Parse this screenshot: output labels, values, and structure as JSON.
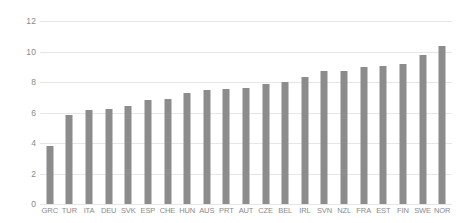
{
  "chart_data": {
    "type": "bar",
    "title": "",
    "subtitle": "",
    "xlabel": "",
    "ylabel": "",
    "ylim": [
      0,
      12
    ],
    "yticks": [
      0,
      2,
      4,
      6,
      8,
      10,
      12
    ],
    "ytick_labels": [
      "0",
      "2",
      "4",
      "6",
      "8",
      "10",
      "12"
    ],
    "grid": true,
    "legend": false,
    "legend_position": "none",
    "bar_color": "#8c8c8c",
    "gridline_color": "#e6e6e6",
    "tick_label_color": "#8a8a8a",
    "background_color": "#ffffff",
    "categories": [
      "GRC",
      "TUR",
      "ITA",
      "DEU",
      "SVK",
      "ESP",
      "CHE",
      "HUN",
      "AUS",
      "PRT",
      "AUT",
      "CZE",
      "BEL",
      "IRL",
      "SVN",
      "NZL",
      "FRA",
      "EST",
      "FIN",
      "SWE",
      "NOR"
    ],
    "values": [
      3.8,
      5.85,
      6.15,
      6.25,
      6.45,
      6.8,
      6.9,
      7.3,
      7.5,
      7.55,
      7.6,
      7.85,
      8.0,
      8.35,
      8.7,
      8.75,
      9.0,
      9.05,
      9.15,
      9.75,
      10.35
    ]
  }
}
